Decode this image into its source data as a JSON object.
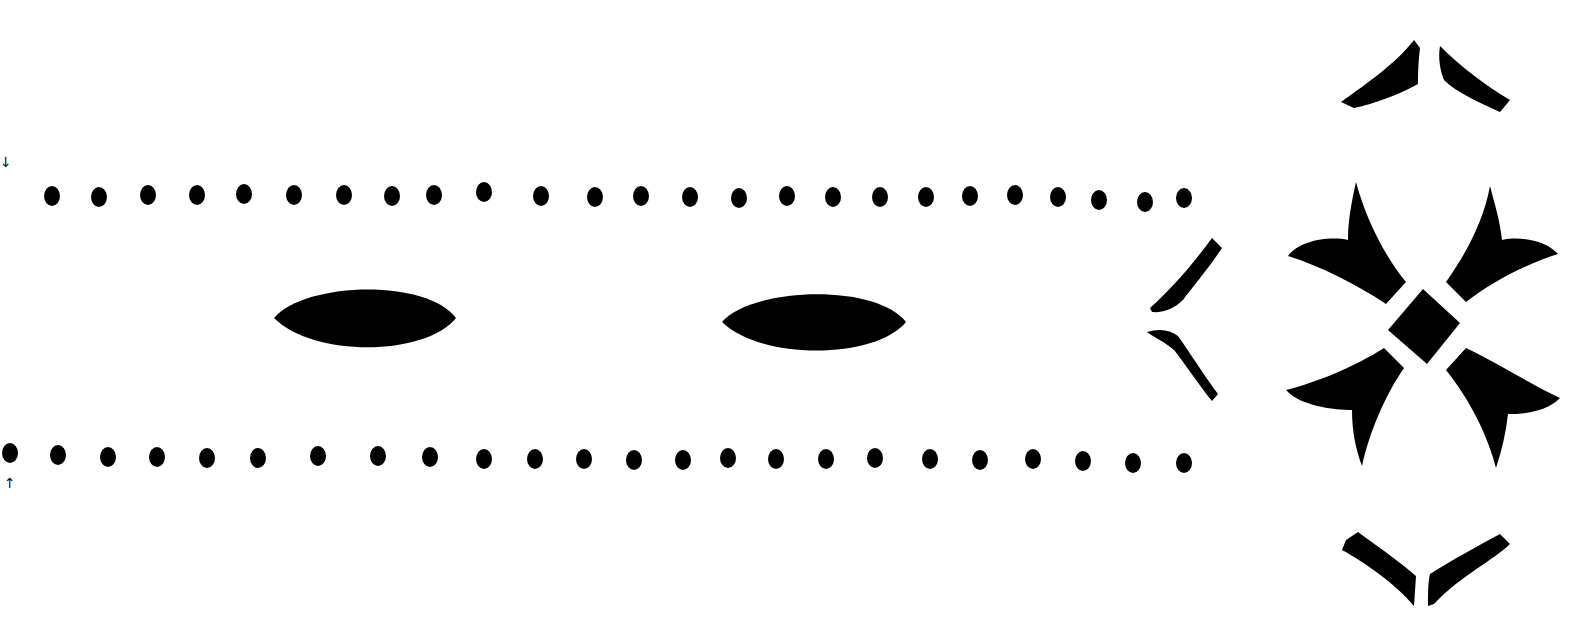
{
  "canvas": {
    "width": 1593,
    "height": 642,
    "background": "#ffffff",
    "ink": "#000000"
  },
  "edge_marks": [
    {
      "name": "arrow-down-mark",
      "glyph": "↓",
      "x": 0,
      "y": 155
    },
    {
      "name": "arrow-up-mark",
      "glyph": "↑",
      "x": 4,
      "y": 476
    }
  ],
  "dot_rows": [
    {
      "name": "top-dot-row",
      "dots": [
        [
          52,
          196
        ],
        [
          99,
          197
        ],
        [
          148,
          195
        ],
        [
          197,
          195
        ],
        [
          244,
          194
        ],
        [
          294,
          195
        ],
        [
          344,
          195
        ],
        [
          392,
          196
        ],
        [
          434,
          195
        ],
        [
          484,
          192
        ],
        [
          541,
          196
        ],
        [
          595,
          197
        ],
        [
          641,
          196
        ],
        [
          690,
          197
        ],
        [
          739,
          198
        ],
        [
          787,
          196
        ],
        [
          833,
          197
        ],
        [
          880,
          197
        ],
        [
          926,
          197
        ],
        [
          970,
          196
        ],
        [
          1015,
          195
        ],
        [
          1058,
          197
        ],
        [
          1099,
          200
        ],
        [
          1145,
          202
        ],
        [
          1184,
          198
        ]
      ]
    },
    {
      "name": "bottom-dot-row",
      "dots": [
        [
          10,
          453
        ],
        [
          58,
          455
        ],
        [
          108,
          457
        ],
        [
          157,
          457
        ],
        [
          207,
          458
        ],
        [
          258,
          458
        ],
        [
          318,
          456
        ],
        [
          378,
          456
        ],
        [
          430,
          457
        ],
        [
          484,
          459
        ],
        [
          535,
          459
        ],
        [
          584,
          459
        ],
        [
          634,
          460
        ],
        [
          683,
          460
        ],
        [
          728,
          458
        ],
        [
          776,
          459
        ],
        [
          826,
          459
        ],
        [
          875,
          458
        ],
        [
          930,
          459
        ],
        [
          980,
          460
        ],
        [
          1033,
          459
        ],
        [
          1083,
          461
        ],
        [
          1133,
          463
        ],
        [
          1184,
          463
        ]
      ]
    }
  ],
  "ovals": [
    {
      "name": "left-lens-oval",
      "cx": 365,
      "cy": 318,
      "rx": 91,
      "ry": 36
    },
    {
      "name": "right-lens-oval",
      "cx": 814,
      "cy": 322,
      "rx": 92,
      "ry": 35
    }
  ],
  "ornaments": {
    "chevron": {
      "name": "left-chevron-ornament",
      "x": 1148,
      "y": 237
    },
    "cross": {
      "name": "four-petal-cross-ornament",
      "cx": 1423,
      "cy": 326
    },
    "top_caret": {
      "name": "top-caret-ornament",
      "cx": 1424,
      "cy": 75
    },
    "bottom_caret": {
      "name": "bottom-caret-ornament",
      "cx": 1424,
      "cy": 568
    }
  }
}
